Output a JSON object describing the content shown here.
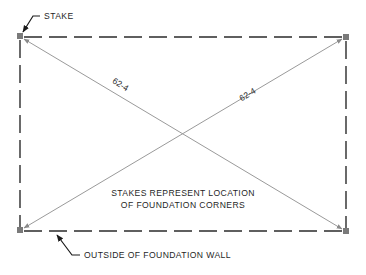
{
  "diagram": {
    "type": "foundation-stake-layout",
    "colors": {
      "wall": "#2b2b2b",
      "diagonal": "#9a9a9a",
      "stake": "#7a7a7a",
      "text": "#1f1f1f",
      "leader": "#1a1a1a"
    },
    "labels": {
      "stake_callout": "STAKE",
      "diagonal_left": "62-4",
      "diagonal_right": "62-4",
      "note_line1": "STAKES REPRESENT LOCATION",
      "note_line2": "OF FOUNDATION CORNERS",
      "wall_callout": "OUTSIDE OF FOUNDATION WALL"
    },
    "corners": [
      {
        "name": "top-left",
        "x": 20,
        "y": 36
      },
      {
        "name": "top-right",
        "x": 346,
        "y": 37
      },
      {
        "name": "bottom-right",
        "x": 346,
        "y": 231
      },
      {
        "name": "bottom-left",
        "x": 20,
        "y": 230
      }
    ]
  }
}
